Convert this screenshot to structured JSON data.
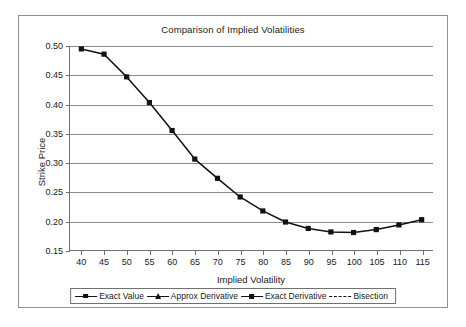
{
  "chart_data": {
    "type": "line",
    "title": "Comparison of Implied Volatilities",
    "xlabel": "Implied Volatility",
    "ylabel": "Strike Price",
    "xlim": [
      37.5,
      117.5
    ],
    "ylim": [
      0.15,
      0.5
    ],
    "xticks": [
      40,
      45,
      50,
      55,
      60,
      65,
      70,
      75,
      80,
      85,
      90,
      95,
      100,
      105,
      110,
      115
    ],
    "xtick_labels": [
      "40",
      "45",
      "50",
      "55",
      "60",
      "65",
      "70",
      "75",
      "80",
      "85",
      "90",
      "95",
      "100",
      "105",
      "110",
      "115"
    ],
    "yticks": [
      0.15,
      0.2,
      0.25,
      0.3,
      0.35,
      0.4,
      0.45,
      0.5
    ],
    "ytick_labels": [
      "0.15",
      "0.20",
      "0.25",
      "0.30",
      "0.35",
      "0.40",
      "0.45",
      "0.50"
    ],
    "grid": "horizontal",
    "legend_position": "bottom",
    "x": [
      40,
      45,
      50,
      55,
      60,
      65,
      70,
      75,
      80,
      85,
      90,
      95,
      100,
      105,
      110,
      115
    ],
    "series": [
      {
        "name": "Exact Value",
        "marker": "dot",
        "line": "solid",
        "color": "#111111",
        "values": [
          0.495,
          0.486,
          0.447,
          0.403,
          0.355,
          0.306,
          0.273,
          0.241,
          0.217,
          0.198,
          0.187,
          0.181,
          0.18,
          0.185,
          0.193,
          0.202
        ]
      },
      {
        "name": "Approx Derivative",
        "marker": "triangle",
        "line": "solid",
        "color": "#111111",
        "values": [
          0.495,
          0.486,
          0.447,
          0.403,
          0.355,
          0.306,
          0.273,
          0.241,
          0.217,
          0.198,
          0.187,
          0.181,
          0.18,
          0.185,
          0.193,
          0.202
        ]
      },
      {
        "name": "Exact Derivative",
        "marker": "square",
        "line": "solid",
        "color": "#111111",
        "values": [
          0.495,
          0.486,
          0.447,
          0.403,
          0.355,
          0.306,
          0.273,
          0.241,
          0.217,
          0.198,
          0.187,
          0.181,
          0.18,
          0.185,
          0.193,
          0.202
        ]
      },
      {
        "name": "Bisection",
        "marker": "none",
        "line": "dashed",
        "color": "#111111",
        "values": [
          0.495,
          0.486,
          0.447,
          0.403,
          0.355,
          0.306,
          0.273,
          0.241,
          0.217,
          0.198,
          0.187,
          0.181,
          0.18,
          0.185,
          0.193,
          0.202
        ]
      }
    ]
  },
  "legend": {
    "entries": [
      {
        "label": "Exact Value",
        "marker": "dot",
        "line": "solid"
      },
      {
        "label": "Approx Derivative",
        "marker": "triangle",
        "line": "solid"
      },
      {
        "label": "Exact Derivative",
        "marker": "square",
        "line": "solid"
      },
      {
        "label": "Bisection",
        "marker": "none",
        "line": "dashed"
      }
    ]
  }
}
